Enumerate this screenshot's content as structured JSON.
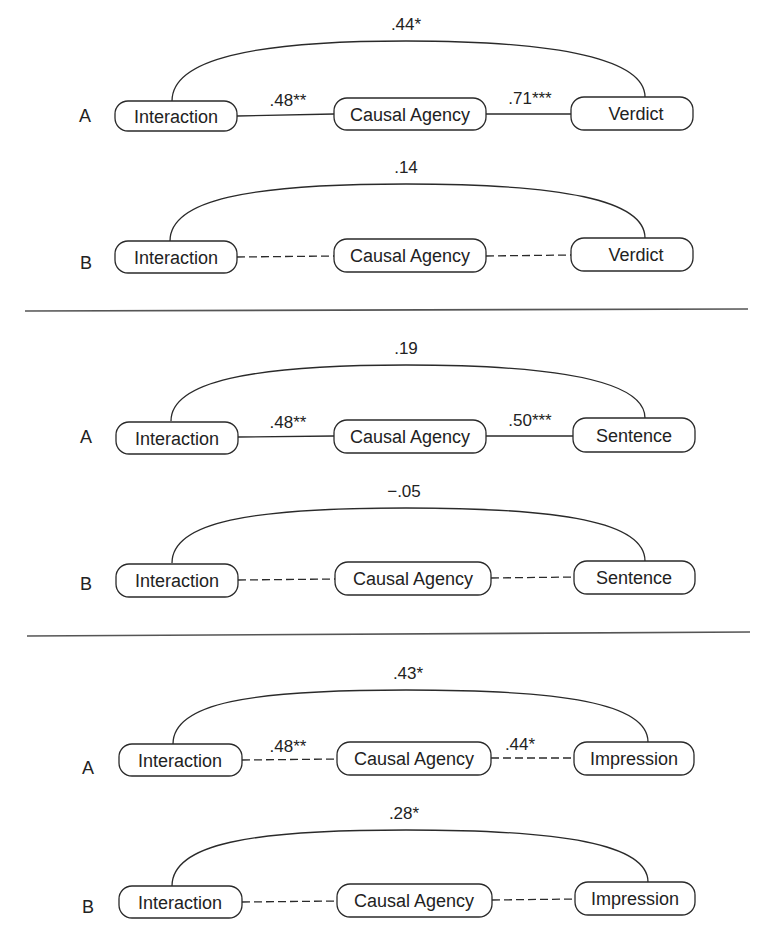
{
  "colors": {
    "line": "#2a2a2a",
    "divider": "#555555",
    "text": "#222222",
    "background": "#ffffff"
  },
  "nodes": {
    "interaction": "Interaction",
    "causal_agency": "Causal Agency",
    "verdict": "Verdict",
    "sentence": "Sentence",
    "impression": "Impression"
  },
  "panels": [
    {
      "outcome": "Verdict",
      "rows": [
        {
          "label": "A",
          "direct": ".44*",
          "a_path": ".48**",
          "b_path": ".71***",
          "mediator_lines": "solid"
        },
        {
          "label": "B",
          "direct": ".14",
          "a_path": "",
          "b_path": "",
          "mediator_lines": "dashed"
        }
      ]
    },
    {
      "outcome": "Sentence",
      "rows": [
        {
          "label": "A",
          "direct": ".19",
          "a_path": ".48**",
          "b_path": ".50***",
          "mediator_lines": "solid"
        },
        {
          "label": "B",
          "direct": "−.05",
          "a_path": "",
          "b_path": "",
          "mediator_lines": "dashed"
        }
      ]
    },
    {
      "outcome": "Impression",
      "rows": [
        {
          "label": "A",
          "direct": ".43*",
          "a_path": ".48**",
          "b_path": ".44*",
          "mediator_lines": "dashed"
        },
        {
          "label": "B",
          "direct": ".28*",
          "a_path": "",
          "b_path": "",
          "mediator_lines": "dashed"
        }
      ]
    }
  ]
}
